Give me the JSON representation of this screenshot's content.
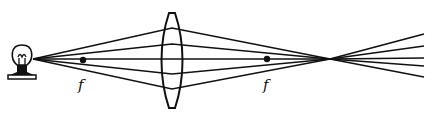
{
  "diagram": {
    "type": "optics-converging-lens",
    "colors": {
      "ink": "#111111",
      "background": "#ffffff"
    },
    "source": {
      "kind": "light-bulb",
      "x": 22,
      "y": 59
    },
    "lens": {
      "kind": "biconvex",
      "center_x": 172,
      "top_y": 13,
      "bottom_y": 108,
      "half_width": 9
    },
    "focal_points": [
      {
        "name": "left-focal-point",
        "x": 83,
        "y": 60,
        "label": "f",
        "label_x": 78,
        "label_y": 90
      },
      {
        "name": "right-focal-point",
        "x": 267,
        "y": 59,
        "label": "f",
        "label_x": 263,
        "label_y": 90
      }
    ],
    "image_point": {
      "x": 330,
      "y": 59
    },
    "rays": [
      {
        "lens_y": 28,
        "end_y": 34
      },
      {
        "lens_y": 44,
        "end_y": 46
      },
      {
        "lens_y": 59,
        "end_y": 58
      },
      {
        "lens_y": 74,
        "end_y": 66
      },
      {
        "lens_y": 89,
        "end_y": 77
      }
    ],
    "ray_start": {
      "x": 33,
      "y": 59
    },
    "ray_end_x": 424
  }
}
